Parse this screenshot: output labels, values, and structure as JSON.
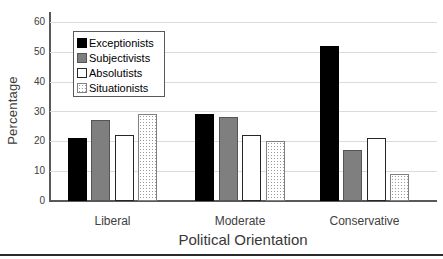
{
  "chart_data": {
    "type": "bar",
    "title": "",
    "xlabel": "Political Orientation",
    "ylabel": "Percentage",
    "categories": [
      "Liberal",
      "Moderate",
      "Conservative"
    ],
    "series": [
      {
        "name": "Exceptionists",
        "values": [
          21,
          29,
          52
        ],
        "fill": "#000000",
        "border": "#000000",
        "pattern": "solid"
      },
      {
        "name": "Subjectivists",
        "values": [
          27,
          28,
          17
        ],
        "fill": "#7f7f7f",
        "border": "#555555",
        "pattern": "solid"
      },
      {
        "name": "Absolutists",
        "values": [
          22,
          22,
          21
        ],
        "fill": "#ffffff",
        "border": "#262626",
        "pattern": "solid"
      },
      {
        "name": "Situationists",
        "values": [
          29,
          20,
          9
        ],
        "fill": "#ffffff",
        "border": "#808080",
        "pattern": "dots"
      }
    ],
    "ylim": [
      0,
      60
    ],
    "yticks": [
      0,
      10,
      20,
      30,
      40,
      50,
      60
    ],
    "grid": true,
    "legend_position": "upper-left-inside",
    "colors": {
      "axis": "#595959",
      "gridline": "#dbdbdb",
      "tick_label": "#404040",
      "dot_pattern": "#9a9a9a"
    }
  }
}
